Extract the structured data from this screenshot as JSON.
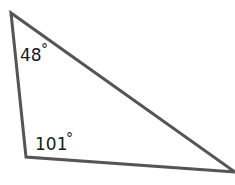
{
  "diagram": {
    "type": "triangle",
    "vertices": [
      {
        "name": "top",
        "x": 11,
        "y": 13
      },
      {
        "name": "bottom-left",
        "x": 26,
        "y": 157
      },
      {
        "name": "right",
        "x": 235,
        "y": 172
      }
    ],
    "stroke_color": "#555555",
    "angles": [
      {
        "vertex": "top",
        "value": "48",
        "unit": "°"
      },
      {
        "vertex": "bottom-left",
        "value": "101",
        "unit": "°"
      }
    ]
  }
}
